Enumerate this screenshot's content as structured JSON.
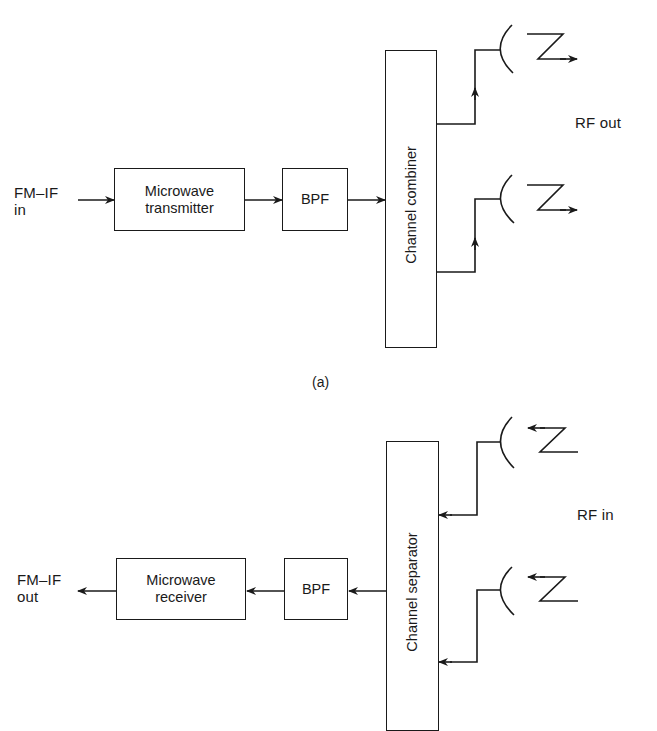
{
  "figure_a": {
    "input_label_line1": "FM–IF",
    "input_label_line2": "in",
    "transmitter_label_line1": "Microwave",
    "transmitter_label_line2": "transmitter",
    "bpf_label": "BPF",
    "combiner_label": "Channel combiner",
    "output_label": "RF out",
    "caption": "(a)",
    "antennas": 2
  },
  "figure_b": {
    "output_label_line1": "FM–IF",
    "output_label_line2": "out",
    "receiver_label_line1": "Microwave",
    "receiver_label_line2": "receiver",
    "bpf_label": "BPF",
    "separator_label": "Channel separator",
    "input_label": "RF in",
    "antennas": 2
  },
  "colors": {
    "line": "#1a1a1a",
    "background": "#ffffff"
  }
}
